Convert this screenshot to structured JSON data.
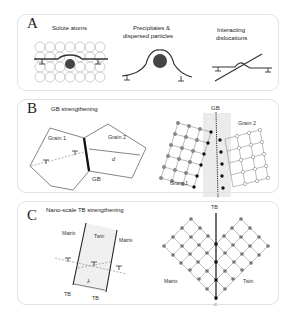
{
  "panels": {
    "a": {
      "letter": "A",
      "titles": [
        "Solute atoms",
        "Precipitates &",
        "dispersed particles",
        "Interacting",
        "dislocations"
      ]
    },
    "b": {
      "letter": "B",
      "title": "GB strengthening",
      "left": {
        "grain1": "Grain 1",
        "grain2": "Grain 2",
        "d": "d",
        "gb": "GB"
      },
      "right": {
        "gb": "GB",
        "grain1": "Grain 1",
        "grain2": "Grain 2"
      }
    },
    "c": {
      "letter": "C",
      "title": "Nano-scale TB strengthening",
      "left": {
        "matrix_l": "Matrix",
        "twin": "Twin",
        "matrix_r": "Matrix",
        "lambda": "λ",
        "tb1": "TB",
        "tb2": "TB"
      },
      "right": {
        "tb": "TB",
        "matrix": "Matrix",
        "twin": "Twin",
        "bottom": "C"
      }
    }
  }
}
